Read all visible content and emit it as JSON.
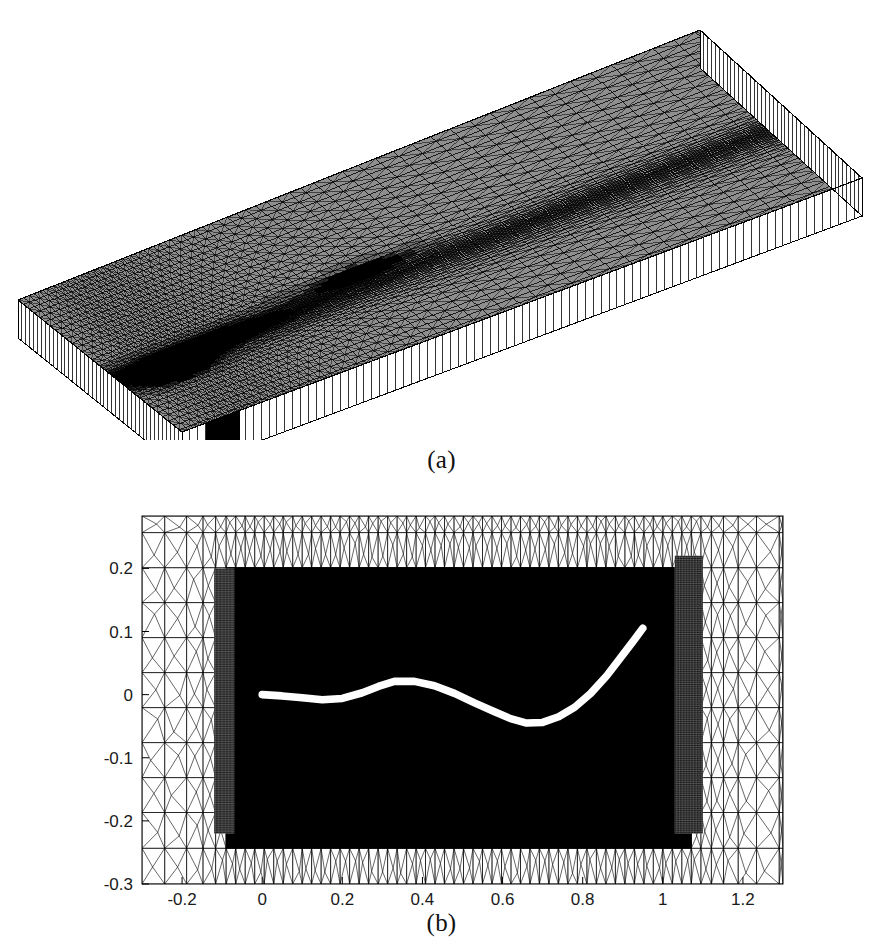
{
  "figure": {
    "caption_a": "(a)",
    "caption_b": "(b)",
    "background_color": "#ffffff",
    "ink_color": "#000000",
    "curve_color": "#ffffff"
  },
  "panel_a": {
    "kind": "3d-extruded-triangular-mesh-slab",
    "description": "Perspective view of a three-dimensional unstructured mesh: a flat rectangular slab whose top face is triangulated and whose thickness is discretised into prism layers, shown as vertical ribs along the two visible side walls. The triangulation is strongly graded, becoming extremely fine (saturating to black) in a wake-like band running from the near-left corner toward the centre of the slab.",
    "projection": {
      "corner_far_left": [
        18,
        300
      ],
      "corner_far_right": [
        700,
        30
      ],
      "corner_near_right": [
        862,
        178
      ],
      "corner_near_left": [
        182,
        432
      ],
      "slab_thickness_px": 38
    },
    "surface_grid": {
      "nu": 86,
      "nv": 42
    },
    "side_wall_ribs": {
      "ribs_long": 86,
      "ribs_short": 42
    },
    "refinement": {
      "comment": "Local element-size field driving the triangulation density on the top face.",
      "base_size": 1.0,
      "features": [
        {
          "name": "wake-band",
          "u": 0.12,
          "v": 0.6,
          "su": 0.3,
          "sv": 0.13,
          "strength": 0.94
        },
        {
          "name": "body-region",
          "u": 0.38,
          "v": 0.53,
          "su": 0.1,
          "sv": 0.07,
          "strength": 0.88
        },
        {
          "name": "leading-cluster",
          "u": 0.07,
          "v": 0.68,
          "su": 0.07,
          "sv": 0.09,
          "strength": 0.97
        },
        {
          "name": "far-field-fade",
          "u": 0.72,
          "v": 0.33,
          "su": 0.4,
          "sv": 0.3,
          "strength": 0.3
        }
      ]
    }
  },
  "panel_b": {
    "kind": "2d-unstructured-triangular-mesh-plot",
    "description": "Plan view of the same unstructured mesh around a slender deformed body. The mesh is heavily refined (appearing solid black) in a rectangular region enclosing the body and its wake, with structured boundary-layer-like bands at the inflow plane near x = -0.1 and at the outflow plane near x = 1.05. A thick white curve marks the deformed body centre-line.",
    "plot_box_px": {
      "left": 142,
      "right": 783,
      "top": 516,
      "bottom": 884
    },
    "curve": {
      "name": "deformed-body-centreline",
      "color": "#ffffff",
      "width_units": 0.012,
      "points": [
        [
          0.0,
          0.0
        ],
        [
          0.05,
          -0.002
        ],
        [
          0.1,
          -0.005
        ],
        [
          0.15,
          -0.008
        ],
        [
          0.2,
          -0.006
        ],
        [
          0.25,
          0.003
        ],
        [
          0.29,
          0.013
        ],
        [
          0.33,
          0.021
        ],
        [
          0.38,
          0.021
        ],
        [
          0.43,
          0.014
        ],
        [
          0.48,
          0.002
        ],
        [
          0.53,
          -0.013
        ],
        [
          0.58,
          -0.027
        ],
        [
          0.62,
          -0.038
        ],
        [
          0.66,
          -0.045
        ],
        [
          0.7,
          -0.044
        ],
        [
          0.74,
          -0.035
        ],
        [
          0.78,
          -0.02
        ],
        [
          0.82,
          0.002
        ],
        [
          0.86,
          0.03
        ],
        [
          0.9,
          0.063
        ],
        [
          0.93,
          0.088
        ],
        [
          0.95,
          0.105
        ]
      ]
    },
    "refined_box": {
      "x0": -0.08,
      "x1": 1.06,
      "y0": -0.2,
      "y1": 0.19
    },
    "structured_bands": [
      {
        "name": "inflow-band",
        "x0": -0.12,
        "x1": -0.07,
        "y0": -0.22,
        "y1": 0.2,
        "nx": 14,
        "ny": 150
      },
      {
        "name": "outflow-band",
        "x0": 1.03,
        "x1": 1.1,
        "y0": -0.22,
        "y1": 0.22,
        "nx": 18,
        "ny": 150
      }
    ]
  },
  "chart_data": {
    "type": "scatter",
    "title": "",
    "subtitle": "",
    "xlabel": "",
    "ylabel": "",
    "grid": false,
    "legend": "none",
    "xlim": [
      -0.3,
      1.3
    ],
    "ylim": [
      -0.3,
      0.283
    ],
    "xticks": [
      -0.2,
      0,
      0.2,
      0.4,
      0.6,
      0.8,
      1,
      1.2
    ],
    "xticklabels": [
      "-0.2",
      "0",
      "0.2",
      "0.4",
      "0.6",
      "0.8",
      "1",
      "1.2"
    ],
    "yticks": [
      0.2,
      0.1,
      0,
      -0.1,
      -0.2,
      -0.3
    ],
    "yticklabels": [
      "0.2",
      "0.1",
      "0",
      "-0.1",
      "-0.2",
      "-0.3"
    ],
    "series": [
      {
        "name": "deformed body centreline",
        "color": "#ffffff",
        "x": [
          0.0,
          0.05,
          0.1,
          0.15,
          0.2,
          0.25,
          0.29,
          0.33,
          0.38,
          0.43,
          0.48,
          0.53,
          0.58,
          0.62,
          0.66,
          0.7,
          0.74,
          0.78,
          0.82,
          0.86,
          0.9,
          0.93,
          0.95
        ],
        "y": [
          0.0,
          -0.002,
          -0.005,
          -0.008,
          -0.006,
          0.003,
          0.013,
          0.021,
          0.021,
          0.014,
          0.002,
          -0.013,
          -0.027,
          -0.038,
          -0.045,
          -0.044,
          -0.035,
          -0.02,
          0.002,
          0.03,
          0.063,
          0.088,
          0.105
        ]
      }
    ],
    "annotations": [
      {
        "text": "(a)",
        "role": "subfigure-label",
        "panel": "a"
      },
      {
        "text": "(b)",
        "role": "subfigure-label",
        "panel": "b"
      }
    ]
  }
}
